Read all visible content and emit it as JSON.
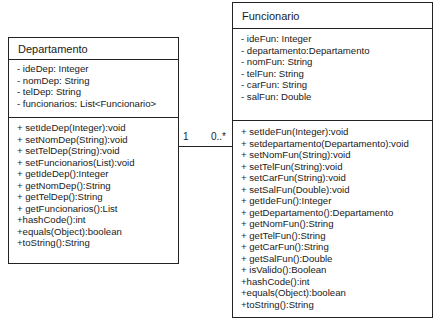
{
  "diagram": {
    "type": "uml-class-diagram",
    "classes": [
      {
        "name": "Departamento",
        "attributes": [
          "- ideDep: Integer",
          "- nomDep: String",
          "- telDep: String",
          "- funcionarios: List<Funcionario>"
        ],
        "methods": [
          "+ setIdeDep(Integer):void",
          "+ setNomDep(String):void",
          "+ setTelDep(String):void",
          "+ setFuncionarios(List):void",
          "+ getIdeDep():Integer",
          "+ getNomDep():String",
          "+ getTelDep():String",
          "+ getFuncionarios():List",
          "+hashCode():int",
          "+equals(Object):boolean",
          "+toString():String"
        ]
      },
      {
        "name": "Funcionario",
        "attributes": [
          "- ideFun: Integer",
          "- departamento:Departamento",
          "- nomFun: String",
          "- telFun: String",
          "- carFun: String",
          "- salFun: Double"
        ],
        "methods": [
          "+ setIdeFun(Integer):void",
          "+ setdepartamento(Departamento):void",
          "+ setNomFun(String):void",
          "+ setTelFun(String):void",
          "+ setCarFun(String):void",
          "+ setSalFun(Double):void",
          "+ getIdeFun():Integer",
          "+ getDepartamento():Departamento",
          "+ getNomFun():String",
          "+ getTelFun():String",
          "+ getCarFun():String",
          "+ getSalFun():Double",
          "+ isValido():Boolean",
          "+hashCode():int",
          "+equals(Object):boolean",
          "+toString():String"
        ]
      }
    ],
    "association": {
      "from": "Departamento",
      "to": "Funcionario",
      "from_multiplicity": "1",
      "to_multiplicity": "0..*"
    }
  }
}
